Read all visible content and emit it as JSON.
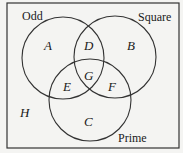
{
  "diagram": {
    "type": "venn",
    "sets": [
      {
        "name": "Odd",
        "label": "Odd"
      },
      {
        "name": "Square",
        "label": "Square"
      },
      {
        "name": "Prime",
        "label": "Prime"
      }
    ],
    "regions": {
      "A": "A",
      "B": "B",
      "C": "C",
      "D": "D",
      "E": "E",
      "F": "F",
      "G": "G",
      "H": "H"
    }
  }
}
